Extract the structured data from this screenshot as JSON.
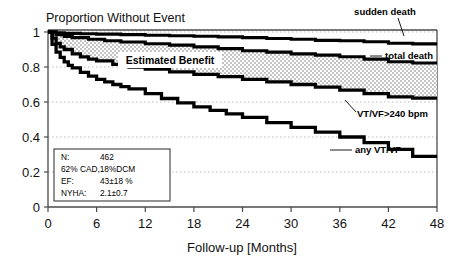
{
  "chart_data": {
    "type": "line",
    "title": "Proportion Without Event",
    "xlabel": "Follow-up [Months]",
    "ylabel": "",
    "xlim": [
      0,
      48
    ],
    "ylim": [
      0,
      1
    ],
    "xticks": [
      "0",
      "6",
      "12",
      "18",
      "24",
      "30",
      "36",
      "42",
      "48"
    ],
    "yticks": [
      "0",
      "0.2",
      "0.4",
      "0.6",
      "0.8",
      "1"
    ],
    "grid": "horizontal-dotted",
    "legend_position": "right-inline-labels",
    "annotations": [
      "Estimated Benefit"
    ],
    "series": [
      {
        "name": "sudden death",
        "x": [
          0,
          1,
          2,
          4,
          6,
          9,
          12,
          15,
          18,
          21,
          24,
          27,
          30,
          33,
          36,
          39,
          42,
          45,
          48
        ],
        "values": [
          1.0,
          0.995,
          0.992,
          0.99,
          0.988,
          0.985,
          0.982,
          0.979,
          0.976,
          0.972,
          0.968,
          0.963,
          0.958,
          0.952,
          0.95,
          0.944,
          0.936,
          0.932,
          0.93
        ]
      },
      {
        "name": "total death",
        "x": [
          0,
          1,
          2,
          3,
          5,
          7,
          9,
          12,
          15,
          18,
          21,
          24,
          27,
          30,
          33,
          36,
          39,
          42,
          45,
          48
        ],
        "values": [
          1.0,
          0.985,
          0.975,
          0.968,
          0.958,
          0.95,
          0.943,
          0.933,
          0.925,
          0.915,
          0.905,
          0.893,
          0.885,
          0.875,
          0.868,
          0.858,
          0.845,
          0.83,
          0.823,
          0.82
        ]
      },
      {
        "name": "VT/VF>240 bpm",
        "x": [
          0,
          0.5,
          1,
          1.5,
          2,
          3,
          4,
          5,
          6,
          8,
          10,
          12,
          15,
          18,
          21,
          24,
          27,
          30,
          33,
          36,
          39,
          42,
          45,
          48
        ],
        "values": [
          1.0,
          0.965,
          0.935,
          0.915,
          0.9,
          0.875,
          0.858,
          0.845,
          0.835,
          0.815,
          0.8,
          0.788,
          0.772,
          0.758,
          0.745,
          0.73,
          0.715,
          0.7,
          0.685,
          0.668,
          0.648,
          0.63,
          0.622,
          0.62
        ]
      },
      {
        "name": "any VT/VF",
        "x": [
          0,
          0.5,
          1,
          1.5,
          2,
          2.5,
          3,
          4,
          5,
          6,
          7,
          8,
          9,
          10,
          12,
          14,
          16,
          18,
          20,
          22,
          24,
          27,
          30,
          33,
          36,
          39,
          42,
          45,
          48
        ],
        "values": [
          1.0,
          0.93,
          0.885,
          0.855,
          0.83,
          0.81,
          0.795,
          0.77,
          0.748,
          0.73,
          0.715,
          0.7,
          0.688,
          0.675,
          0.648,
          0.62,
          0.595,
          0.572,
          0.552,
          0.532,
          0.512,
          0.482,
          0.455,
          0.428,
          0.4,
          0.368,
          0.33,
          0.29,
          0.28
        ]
      }
    ]
  },
  "labels": {
    "sudden_death": "sudden death",
    "total_death": "total death",
    "vtvf240": "VT/VF>240 bpm",
    "any_vtvf": "any VT/VF",
    "estimated_benefit": "Estimated Benefit"
  },
  "stats_box": {
    "rows": [
      {
        "key": "N:",
        "value": "462"
      },
      {
        "key": "62% CAD,18%DCM",
        "value": ""
      },
      {
        "key": "EF:",
        "value": "43±18 %"
      },
      {
        "key": "NYHA:",
        "value": "2.1±0.7"
      }
    ]
  },
  "colors": {
    "curve": "#000000",
    "grid": "#b9b9b9",
    "axis": "#555555",
    "stipple": "#000000"
  }
}
